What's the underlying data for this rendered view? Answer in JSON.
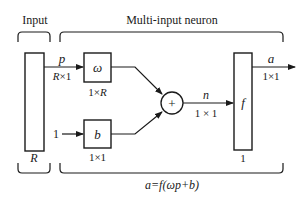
{
  "diagram": {
    "title_input": "Input",
    "title_neuron": "Multi-input neuron",
    "input_vector": {
      "symbol": "p",
      "dims": "R×1"
    },
    "input_size": "R",
    "weight": {
      "symbol": "ω",
      "dims": "1×R"
    },
    "bias_input": "1",
    "bias": {
      "symbol": "b",
      "dims": "1×1"
    },
    "summer": {
      "symbol": "+"
    },
    "net_input": {
      "symbol": "n",
      "dims": "1 × 1"
    },
    "transfer": {
      "symbol": "f",
      "size": "1"
    },
    "output": {
      "symbol": "a",
      "dims": "1×1"
    },
    "formula": "a=f(ωp+b)",
    "colors": {
      "stroke": "#1a1a1a",
      "background": "#ffffff"
    }
  }
}
